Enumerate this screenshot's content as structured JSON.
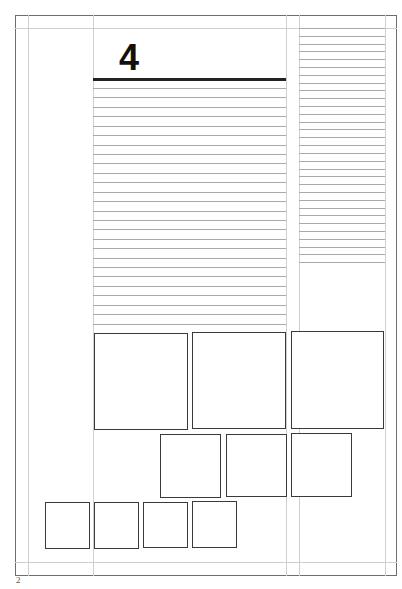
{
  "document": {
    "type": "page-layout-template",
    "chapter_number": "4",
    "page_number": "2",
    "colors": {
      "border": "#6e6e6e",
      "guides": "#cfcfcf",
      "text_lines": "#a9a9a9",
      "frames": "#3a3a3a",
      "chapter_rule": "#222222"
    },
    "main_column": {
      "text_line_count": 26
    },
    "side_column": {
      "text_line_count": 31
    },
    "image_frames": {
      "row1_large": 3,
      "row2_medium": 3,
      "row3_small": 4
    }
  }
}
